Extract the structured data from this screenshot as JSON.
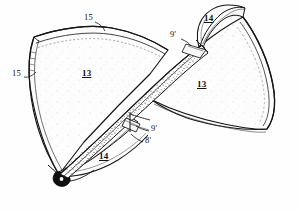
{
  "figure": {
    "style": "stippled line-art patent drawing",
    "background_color": "#fefefe",
    "ink_color": "#111111",
    "width": 299,
    "height": 212
  },
  "reference_numerals": [
    {
      "id": "ref-15-top",
      "label": "15",
      "underlined": false,
      "x": 84,
      "y": 18,
      "points_to": "upper edge of left wing member",
      "leader": {
        "x1": 95,
        "y1": 22,
        "x2": 104,
        "y2": 30
      }
    },
    {
      "id": "ref-15-left",
      "label": "15",
      "underlined": false,
      "x": 12,
      "y": 74,
      "points_to": "outer left edge of left wing member",
      "leader": {
        "x1": 24,
        "y1": 77,
        "x2": 35,
        "y2": 72
      }
    },
    {
      "id": "ref-13-left",
      "label": "13",
      "underlined": true,
      "x": 82,
      "y": 74,
      "points_to": "face of left wing member",
      "leader": null
    },
    {
      "id": "ref-13-right",
      "label": "13",
      "underlined": true,
      "x": 197,
      "y": 85,
      "points_to": "face of right wing member",
      "leader": null
    },
    {
      "id": "ref-14-top",
      "label": "14",
      "underlined": true,
      "x": 204,
      "y": 19,
      "points_to": "upper folded flap of right wing member",
      "leader": null
    },
    {
      "id": "ref-14-bottom",
      "label": "14",
      "underlined": true,
      "x": 99,
      "y": 157,
      "points_to": "lower folded flap of left wing member",
      "leader": null
    },
    {
      "id": "ref-9-prime-upper",
      "label": "9'",
      "underlined": false,
      "x": 170,
      "y": 35,
      "points_to": "upper junction seam",
      "leader": {
        "x1": 181,
        "y1": 39,
        "x2": 190,
        "y2": 45
      }
    },
    {
      "id": "ref-9-prime-lower",
      "label": "9'",
      "underlined": false,
      "x": 150,
      "y": 129,
      "points_to": "lower junction seam",
      "leader": {
        "x1": 149,
        "y1": 131,
        "x2": 137,
        "y2": 126
      }
    },
    {
      "id": "ref-8-prime",
      "label": "8'",
      "underlined": false,
      "x": 144,
      "y": 141,
      "points_to": "lower hinge edge",
      "leader": {
        "x1": 143,
        "y1": 142,
        "x2": 133,
        "y2": 134
      }
    }
  ],
  "parts": [
    {
      "name": "left-wing-member",
      "numeral": "13",
      "description": "Large left fan-shaped panel, apex at lower left"
    },
    {
      "name": "right-wing-member",
      "numeral": "13",
      "description": "Large right fan-shaped panel, apex at upper right"
    },
    {
      "name": "upper-flap",
      "numeral": "14",
      "description": "Narrow folded flap at top of right member"
    },
    {
      "name": "lower-flap",
      "numeral": "14",
      "description": "Narrow folded flap at bottom of left member"
    },
    {
      "name": "outer-edge-band",
      "numeral": "15",
      "description": "Hemmed outer edge band of wing members"
    },
    {
      "name": "junction-seam",
      "numeral": "9'",
      "description": "Seam where the two members cross"
    },
    {
      "name": "hinge-edge",
      "numeral": "8'",
      "description": "Hinge line at lower flap"
    }
  ]
}
